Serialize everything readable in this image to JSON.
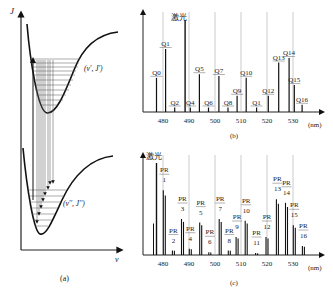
{
  "panel_a": {
    "caption": "(a)",
    "y_axis_label": "J",
    "x_axis_label": "v",
    "upper_state_label": "(v', J')",
    "lower_state_label": "(v'', J'')"
  },
  "panel_b": {
    "caption": "(b)",
    "laser_label": "激光",
    "unit_label": "(nm)",
    "ticks": [
      "480",
      "490",
      "500",
      "510",
      "520",
      "530"
    ],
    "peaks": [
      {
        "label": "Q0",
        "x": 477.5,
        "h": 0.38
      },
      {
        "label": "Q1",
        "x": 481.0,
        "h": 0.7
      },
      {
        "label": "Q2",
        "x": 484.5,
        "h": 0.05
      },
      {
        "label": "Q4",
        "x": 490.5,
        "h": 0.05
      },
      {
        "label": "Q5",
        "x": 494.0,
        "h": 0.42
      },
      {
        "label": "Q6",
        "x": 497.5,
        "h": 0.05
      },
      {
        "label": "Q7",
        "x": 501.5,
        "h": 0.4
      },
      {
        "label": "Q8",
        "x": 505.0,
        "h": 0.05
      },
      {
        "label": "Q9",
        "x": 508.5,
        "h": 0.18
      },
      {
        "label": "Q10",
        "x": 512.0,
        "h": 0.38
      },
      {
        "label": "Q1",
        "x": 516.0,
        "h": 0.05
      },
      {
        "label": "Q12",
        "x": 520.5,
        "h": 0.18
      },
      {
        "label": "Q13",
        "x": 524.5,
        "h": 0.55
      },
      {
        "label": "Q14",
        "x": 528.5,
        "h": 0.6
      },
      {
        "label": "Q15",
        "x": 530.5,
        "h": 0.3
      },
      {
        "label": "Q16",
        "x": 533.5,
        "h": 0.08
      }
    ],
    "laser_x": 488.5
  },
  "panel_c": {
    "caption": "(c)",
    "laser_label": "激光",
    "unit_label": "(nm)",
    "ticks": [
      "480",
      "490",
      "500",
      "510",
      "520",
      "530"
    ],
    "peaks": [
      {
        "label": "PR 1",
        "x": 480.5,
        "h": 0.72
      },
      {
        "label": "PR 2",
        "x": 484.0,
        "h": 0.05
      },
      {
        "label": "PR 3",
        "x": 487.5,
        "h": 0.4
      },
      {
        "label": "PR 4",
        "x": 490.5,
        "h": 0.07
      },
      {
        "label": "PR 5",
        "x": 494.5,
        "h": 0.36
      },
      {
        "label": "PR 6",
        "x": 498.0,
        "h": 0.03
      },
      {
        "label": "PR 7",
        "x": 502.0,
        "h": 0.4
      },
      {
        "label": "PR 8",
        "x": 505.5,
        "h": 0.05
      },
      {
        "label": "PR 9",
        "x": 508.5,
        "h": 0.2
      },
      {
        "label": "PR 10",
        "x": 512.0,
        "h": 0.38
      },
      {
        "label": "PR 11",
        "x": 516.0,
        "h": 0.02
      },
      {
        "label": "PR 12",
        "x": 520.0,
        "h": 0.2
      },
      {
        "label": "PR 13",
        "x": 524.0,
        "h": 0.62
      },
      {
        "label": "PR 14",
        "x": 527.5,
        "h": 0.58
      },
      {
        "label": "PR 15",
        "x": 530.5,
        "h": 0.33
      },
      {
        "label": "PR 16",
        "x": 534.0,
        "h": 0.1
      }
    ],
    "laser_x": 477.5
  },
  "chart_data": [
    {
      "type": "bar",
      "title": "(b)",
      "xlabel": "(nm)",
      "annotation": "激光",
      "x_ticks": [
        480,
        490,
        500,
        510,
        520,
        530
      ],
      "categories": [
        "Q0",
        "Q1",
        "Q2",
        "Q4",
        "Q5",
        "Q6",
        "Q7",
        "Q8",
        "Q9",
        "Q10",
        "Q1",
        "Q12",
        "Q13",
        "Q14",
        "Q15",
        "Q16"
      ],
      "x": [
        477.5,
        481,
        484.5,
        490.5,
        494,
        497.5,
        501.5,
        505,
        508.5,
        512,
        516,
        520.5,
        524.5,
        528.5,
        530.5,
        533.5
      ],
      "values": [
        0.38,
        0.7,
        0.05,
        0.05,
        0.42,
        0.05,
        0.4,
        0.05,
        0.18,
        0.38,
        0.05,
        0.18,
        0.55,
        0.6,
        0.3,
        0.08
      ]
    },
    {
      "type": "bar",
      "title": "(c)",
      "xlabel": "(nm)",
      "annotation": "激光",
      "x_ticks": [
        480,
        490,
        500,
        510,
        520,
        530
      ],
      "categories": [
        "PR 1",
        "PR 2",
        "PR 3",
        "PR 4",
        "PR 5",
        "PR 6",
        "PR 7",
        "PR 8",
        "PR 9",
        "PR 10",
        "PR 11",
        "PR 12",
        "PR 13",
        "PR 14",
        "PR 15",
        "PR 16"
      ],
      "x": [
        480.5,
        484,
        487.5,
        490.5,
        494.5,
        498,
        502,
        505.5,
        508.5,
        512,
        516,
        520,
        524,
        527.5,
        530.5,
        534
      ],
      "values": [
        0.72,
        0.05,
        0.4,
        0.07,
        0.36,
        0.03,
        0.4,
        0.05,
        0.2,
        0.38,
        0.02,
        0.2,
        0.62,
        0.58,
        0.33,
        0.1
      ]
    }
  ]
}
